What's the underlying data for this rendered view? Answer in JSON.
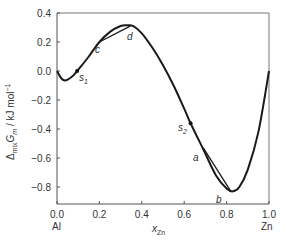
{
  "chart_data": {
    "type": "line",
    "title": "",
    "xlabel": "x_Zn",
    "ylabel": "Δmix Gm / kJ mol⁻¹",
    "xlim": [
      0.0,
      1.0
    ],
    "ylim": [
      -0.92,
      0.4
    ],
    "grid": false,
    "legend": null,
    "x_ticks": [
      "0.0",
      "0.2",
      "0.4",
      "0.6",
      "0.8",
      "1.0"
    ],
    "y_ticks": [
      "0.4",
      "0.2",
      "0.0",
      "−0.2",
      "−0.4",
      "−0.6",
      "−0.8"
    ],
    "x_end_labels": {
      "left": "Al",
      "right": "Zn"
    },
    "series": [
      {
        "name": "ΔmixGm",
        "x": [
          0.0,
          0.02,
          0.04,
          0.07,
          0.095,
          0.15,
          0.2,
          0.25,
          0.3,
          0.33,
          0.36,
          0.4,
          0.45,
          0.5,
          0.55,
          0.6,
          0.63,
          0.69,
          0.75,
          0.8,
          0.83,
          0.86,
          0.9,
          0.95,
          1.0
        ],
        "y": [
          0.0,
          -0.05,
          -0.065,
          -0.04,
          0.0,
          0.1,
          0.2,
          0.27,
          0.31,
          0.315,
          0.31,
          0.26,
          0.16,
          0.04,
          -0.1,
          -0.26,
          -0.36,
          -0.54,
          -0.72,
          -0.81,
          -0.83,
          -0.8,
          -0.68,
          -0.42,
          0.0
        ]
      }
    ],
    "tangent_lines": [
      {
        "from": "c",
        "to": "d",
        "x": [
          0.2,
          0.345
        ],
        "y": [
          0.2,
          0.31
        ]
      },
      {
        "from": "a",
        "to": "b",
        "x": [
          0.69,
          0.82
        ],
        "y": [
          -0.53,
          -0.83
        ]
      }
    ],
    "annotations": [
      {
        "label": "s1",
        "x": 0.095,
        "y": 0.0,
        "marker": true
      },
      {
        "label": "c",
        "x": 0.2,
        "y": 0.2
      },
      {
        "label": "d",
        "x": 0.345,
        "y": 0.31
      },
      {
        "label": "s2",
        "x": 0.63,
        "y": -0.36,
        "marker": true
      },
      {
        "label": "a",
        "x": 0.69,
        "y": -0.53
      },
      {
        "label": "b",
        "x": 0.82,
        "y": -0.83
      }
    ]
  },
  "labels": {
    "y_axis_main": "Δ",
    "y_axis_sub1": "mix",
    "y_axis_G": "G",
    "y_axis_sub2": "m",
    "y_axis_units": " / kJ mol",
    "y_axis_exp": "−1",
    "x_axis_main": "x",
    "x_axis_sub": "Zn",
    "left_end": "Al",
    "right_end": "Zn",
    "s1": "s",
    "s1_sub": "1",
    "s2": "s",
    "s2_sub": "2",
    "c": "c",
    "d": "d",
    "a": "a",
    "b": "b"
  }
}
